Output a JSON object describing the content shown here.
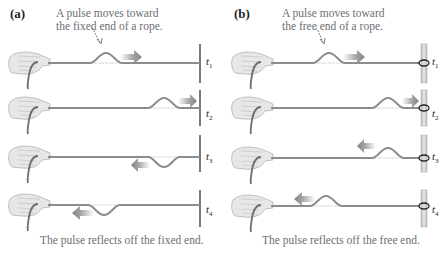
{
  "panels": [
    {
      "id": "a",
      "label": "(a)",
      "callout": [
        "A pulse moves toward",
        "the fixed end of a rope."
      ],
      "caption": "The pulse reflects off the fixed end.",
      "end_type": "fixed",
      "rows": [
        {
          "time": "t",
          "sub": "1",
          "pulse": "up",
          "pulse_x": 90,
          "arrow": "right",
          "arrow_x": 125
        },
        {
          "time": "t",
          "sub": "2",
          "pulse": "up",
          "pulse_x": 148,
          "arrow": "right",
          "arrow_x": 183
        },
        {
          "time": "t",
          "sub": "3",
          "pulse": "down",
          "pulse_x": 148,
          "arrow": "left",
          "arrow_x": 138
        },
        {
          "time": "t",
          "sub": "4",
          "pulse": "down",
          "pulse_x": 88,
          "arrow": "left",
          "arrow_x": 80
        }
      ]
    },
    {
      "id": "b",
      "label": "(b)",
      "callout": [
        "A pulse moves toward",
        "the free end of a rope."
      ],
      "caption": "The pulse reflects off the free end.",
      "end_type": "free",
      "rows": [
        {
          "time": "t",
          "sub": "1",
          "pulse": "up",
          "pulse_x": 313,
          "arrow": "right",
          "arrow_x": 348
        },
        {
          "time": "t",
          "sub": "2",
          "pulse": "up",
          "pulse_x": 372,
          "arrow": "right",
          "arrow_x": 407
        },
        {
          "time": "t",
          "sub": "3",
          "pulse": "up",
          "pulse_x": 372,
          "arrow": "left",
          "arrow_x": 363
        },
        {
          "time": "t",
          "sub": "4",
          "pulse": "up",
          "pulse_x": 310,
          "arrow": "left",
          "arrow_x": 302
        }
      ]
    }
  ],
  "colors": {
    "rope": "#8a8c8e",
    "wall": "#4d4d4f",
    "post": "#c9cacb",
    "arrow": "#939598",
    "hand": "#d9dadb",
    "text": "#6d6e71",
    "dashed_baseline": "#c7c8ca"
  }
}
